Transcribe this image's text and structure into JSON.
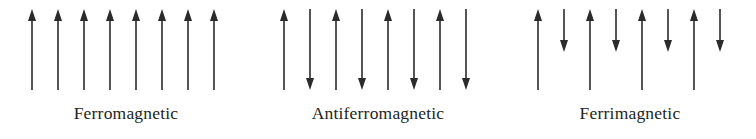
{
  "figure": {
    "background_color": "#ffffff",
    "arrow_color": "#2b2b2b",
    "caption_color": "#231f20",
    "width": 756,
    "height": 139
  },
  "panels": [
    {
      "id": "ferromagnetic",
      "caption": "Ferromagnetic",
      "x": 0,
      "width": 252,
      "arrow_count": 8,
      "first_arrow_x": 32,
      "arrow_spacing": 26,
      "arrows": [
        {
          "direction": "up",
          "length": "long"
        },
        {
          "direction": "up",
          "length": "long"
        },
        {
          "direction": "up",
          "length": "long"
        },
        {
          "direction": "up",
          "length": "long"
        },
        {
          "direction": "up",
          "length": "long"
        },
        {
          "direction": "up",
          "length": "long"
        },
        {
          "direction": "up",
          "length": "long"
        },
        {
          "direction": "up",
          "length": "long"
        }
      ]
    },
    {
      "id": "antiferromagnetic",
      "caption": "Antiferromagnetic",
      "x": 252,
      "width": 252,
      "arrow_count": 8,
      "first_arrow_x": 32,
      "arrow_spacing": 26,
      "arrows": [
        {
          "direction": "up",
          "length": "long"
        },
        {
          "direction": "down",
          "length": "long"
        },
        {
          "direction": "up",
          "length": "long"
        },
        {
          "direction": "down",
          "length": "long"
        },
        {
          "direction": "up",
          "length": "long"
        },
        {
          "direction": "down",
          "length": "long"
        },
        {
          "direction": "up",
          "length": "long"
        },
        {
          "direction": "down",
          "length": "long"
        }
      ]
    },
    {
      "id": "ferrimagnetic",
      "caption": "Ferrimagnetic",
      "x": 504,
      "width": 252,
      "arrow_count": 8,
      "first_arrow_x": 34,
      "arrow_spacing": 26,
      "arrows": [
        {
          "direction": "up",
          "length": "long"
        },
        {
          "direction": "down",
          "length": "short"
        },
        {
          "direction": "up",
          "length": "long"
        },
        {
          "direction": "down",
          "length": "short"
        },
        {
          "direction": "up",
          "length": "long"
        },
        {
          "direction": "down",
          "length": "short"
        },
        {
          "direction": "up",
          "length": "long"
        },
        {
          "direction": "down",
          "length": "short"
        }
      ]
    }
  ],
  "geometry": {
    "arrow_top": 9,
    "arrow_bottom": 90,
    "short_arrow_bottom": 52,
    "stem_width": 1.6,
    "head_width": 8,
    "head_length": 12
  }
}
